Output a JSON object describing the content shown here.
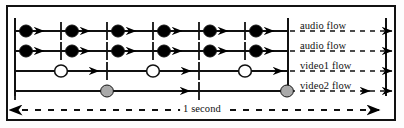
{
  "figure": {
    "background_color": "#ffffff",
    "border_color": "#111111"
  },
  "flows": [
    {
      "id": "audio-flow-1",
      "label": "audio flow",
      "marker": "filled-black-circle",
      "marker_color": "#000000",
      "y": 31,
      "marker_x": [
        26,
        72,
        118,
        164,
        210,
        256
      ],
      "tick_x": [
        15,
        61,
        107,
        153,
        199,
        245
      ],
      "arrow_x": [
        44,
        90,
        136,
        182,
        228,
        274
      ],
      "label_x": 300,
      "label_y": 20
    },
    {
      "id": "audio-flow-2",
      "label": "audio flow",
      "marker": "filled-black-circle",
      "marker_color": "#000000",
      "y": 51,
      "marker_x": [
        26,
        72,
        118,
        164,
        210,
        256
      ],
      "tick_x": [
        15,
        61,
        107,
        153,
        199,
        245
      ],
      "arrow_x": [
        44,
        90,
        136,
        182,
        228,
        274
      ],
      "label_x": 300,
      "label_y": 40
    },
    {
      "id": "video1-flow",
      "label": "video1 flow",
      "marker": "open-white-circle",
      "marker_color": "#ffffff",
      "y": 71,
      "marker_x": [
        61,
        153,
        245
      ],
      "tick_x": [
        15,
        107,
        199
      ],
      "arrow_x": [
        99,
        191,
        283
      ],
      "label_x": 300,
      "label_y": 60
    },
    {
      "id": "video2-flow",
      "label": "video2 flow",
      "marker": "filled-gray-circle",
      "marker_color": "#a9a9a9",
      "y": 91,
      "marker_x": [
        107,
        287
      ],
      "tick_x": [
        15,
        199
      ],
      "arrow_x": [
        190,
        370
      ],
      "label_x": 300,
      "label_y": 80
    }
  ],
  "boundaries": {
    "left_rail_x": 15,
    "inner_rail_x": 288,
    "right_rail_x": 386,
    "rail_top": 18,
    "rail_bottom": 96
  },
  "timescale": {
    "label": "1 second",
    "label_x": 202,
    "y": 110,
    "left_arrow_x": 22,
    "right_arrow_x": 380,
    "style": "dashed-double-arrow"
  },
  "legend": {
    "marker_meanings": [
      {
        "name": "filled-black-circle",
        "flow": "audio flow"
      },
      {
        "name": "open-white-circle",
        "flow": "video1 flow"
      },
      {
        "name": "filled-gray-circle",
        "flow": "video2 flow"
      }
    ]
  }
}
